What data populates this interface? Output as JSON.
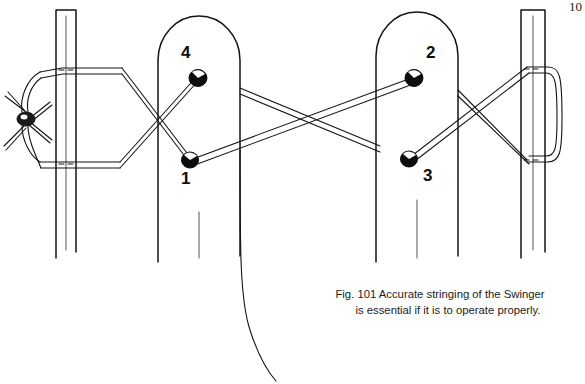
{
  "figure": {
    "caption_line1": "Fig. 101 Accurate stringing of the Swinger",
    "caption_line2": "is essential if it is to operate properly.",
    "caption_full": "Fig. 101 Accurate stringing of the Swinger is essential if it is to operate properly.",
    "figure_number": "Fig. 101",
    "page_number": "10",
    "title": "Accurate stringing of the Swinger"
  },
  "diagram": {
    "type": "line-drawing",
    "ink_color": "#111111",
    "paper_color": "#ffffff",
    "knob_fill": "#0d0d0d",
    "stroke_width": 1.6,
    "posts": [
      {
        "name": "left-stake",
        "kind": "flat-stake",
        "x_left": 56,
        "x_right": 76,
        "y_top": 10,
        "y_bottom": 258,
        "top_shape": "flat"
      },
      {
        "name": "left-decoy-body",
        "kind": "rounded-body",
        "x_left": 158,
        "x_right": 240,
        "y_top": 18,
        "y_bottom": 262,
        "top_shape": "dome"
      },
      {
        "name": "right-decoy-body",
        "kind": "rounded-body",
        "x_left": 376,
        "x_right": 458,
        "y_top": 14,
        "y_bottom": 262,
        "top_shape": "dome"
      },
      {
        "name": "right-stake",
        "kind": "flat-stake",
        "x_left": 521,
        "x_right": 545,
        "y_top": 10,
        "y_bottom": 258,
        "top_shape": "flat"
      }
    ],
    "knobs": [
      {
        "label": "1",
        "name": "knob-1",
        "cx": 190,
        "cy": 160,
        "label_x": 182,
        "label_y": 168,
        "label_position": "below-left"
      },
      {
        "label": "2",
        "name": "knob-2",
        "cx": 414,
        "cy": 77,
        "label_x": 424,
        "label_y": 54,
        "label_position": "above-right"
      },
      {
        "label": "3",
        "name": "knob-3",
        "cx": 409,
        "cy": 158,
        "label_x": 421,
        "label_y": 166,
        "label_position": "below-right"
      },
      {
        "label": "4",
        "name": "knob-4",
        "cx": 198,
        "cy": 78,
        "label_x": 180,
        "label_y": 52,
        "label_position": "above-left"
      }
    ],
    "knot": {
      "name": "left-knot",
      "cx": 26,
      "cy": 118,
      "description": "overhand knot with two loose tag ends"
    },
    "strings": [
      {
        "name": "left-post-upper-wrap",
        "from": "knot",
        "to": "left-stake-upper"
      },
      {
        "name": "left-post-lower-wrap",
        "from": "knot",
        "to": "left-stake-lower"
      },
      {
        "name": "string-left-upper-to-knob-1",
        "from": "left-stake-upper",
        "to": "knob-1"
      },
      {
        "name": "string-left-lower-to-knob-4",
        "from": "left-stake-lower",
        "to": "knob-4"
      },
      {
        "name": "string-knob-4-to-right-lower",
        "from": "knob-4",
        "to": "mid-lower"
      },
      {
        "name": "string-knob-1-to-knob-2",
        "from": "knob-1",
        "to": "knob-2"
      },
      {
        "name": "string-knob-3-to-right-upper",
        "from": "knob-3",
        "to": "right-stake-upper"
      },
      {
        "name": "string-mid-upper-to-right-lower",
        "from": "mid-upper",
        "to": "right-stake-lower"
      },
      {
        "name": "right-post-loop",
        "from": "right-stake-upper",
        "to": "right-stake-lower"
      },
      {
        "name": "trailing-line",
        "from": "left-decoy-body-bottom",
        "to": "page-bottom"
      }
    ]
  }
}
